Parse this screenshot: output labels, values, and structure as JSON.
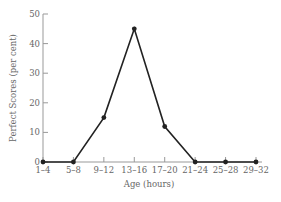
{
  "chart_data": {
    "type": "line",
    "title": "",
    "xlabel": "Age (hours)",
    "ylabel": "Perfect Scores (per cent)",
    "categories": [
      "1–4",
      "5–8",
      "9–12",
      "13–16",
      "17–20",
      "21–24",
      "25–28",
      "29–32"
    ],
    "values": [
      0,
      0,
      15,
      45,
      12,
      0,
      0,
      0
    ],
    "ylim": [
      0,
      50
    ],
    "yticks": [
      0,
      10,
      20,
      30,
      40,
      50
    ],
    "grid": false,
    "legend": null,
    "colors": {
      "line": "#222222",
      "axis": "#999999",
      "text": "#666666"
    }
  }
}
